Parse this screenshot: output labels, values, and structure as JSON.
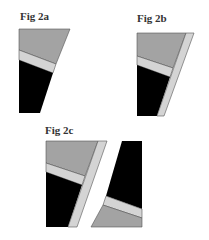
{
  "figures": [
    {
      "id": "2a",
      "label": "Fig 2a"
    },
    {
      "id": "2b",
      "label": "Fig 2b"
    },
    {
      "id": "2c",
      "label": "Fig 2c"
    }
  ],
  "colors": {
    "dark_gray": "#a3a3a3",
    "light_gray": "#d4d4d4",
    "black": "#000000",
    "outline": "#555555"
  }
}
